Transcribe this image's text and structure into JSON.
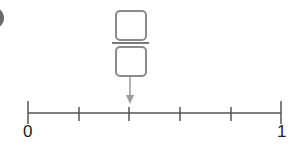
{
  "badge": {
    "visible": "partially-cropped"
  },
  "fraction": {
    "numerator": "",
    "denominator": "",
    "box_color": "#8a8a8a"
  },
  "number_line": {
    "start_label": "0",
    "end_label": "1",
    "divisions": 5,
    "tick_values": [
      "0",
      "1/5",
      "2/5",
      "3/5",
      "4/5",
      "1"
    ],
    "arrow_points_to_tick": 2,
    "line_color": "#555555",
    "arrow_color": "#999999"
  }
}
